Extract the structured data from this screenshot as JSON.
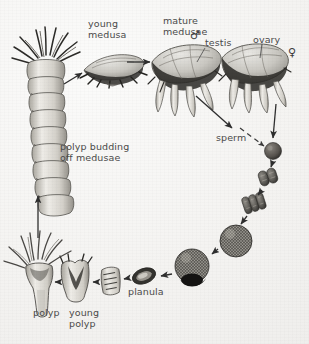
{
  "figure": {
    "background_color": "#f4f3f1",
    "ink_color": "#3c3c3c",
    "label_color": "#4a4a4a"
  },
  "labels": [
    {
      "id": "young-medusa",
      "text": "young\nmedusa",
      "x": 88,
      "y": 19
    },
    {
      "id": "mature-medusae",
      "text": "mature\nmedusae",
      "x": 163,
      "y": 16
    },
    {
      "id": "testis",
      "text": "testis",
      "x": 205,
      "y": 38
    },
    {
      "id": "ovary",
      "text": "ovary",
      "x": 253,
      "y": 35
    },
    {
      "id": "sperm",
      "text": "sperm",
      "x": 216,
      "y": 133
    },
    {
      "id": "polyp-budding",
      "text": "polyp budding\noff medusae",
      "x": 60,
      "y": 142
    },
    {
      "id": "planula",
      "text": "planula",
      "x": 128,
      "y": 287
    },
    {
      "id": "polyp",
      "text": "polyp",
      "x": 33,
      "y": 308
    },
    {
      "id": "young-polyp",
      "text": "young\npolyp",
      "x": 69,
      "y": 308
    }
  ],
  "symbols": [
    {
      "id": "male-symbol",
      "glyph": "♂",
      "x": 190,
      "y": 30
    },
    {
      "id": "female-symbol",
      "glyph": "♀",
      "x": 288,
      "y": 47
    }
  ],
  "stages": [
    {
      "id": "strobila",
      "name": "polyp budding off medusae (strobila)"
    },
    {
      "id": "young-medusa",
      "name": "young medusa"
    },
    {
      "id": "mature-medusa-male",
      "name": "mature medusa with testis"
    },
    {
      "id": "mature-medusa-female",
      "name": "mature medusa with ovary"
    },
    {
      "id": "sperm",
      "name": "sperm"
    },
    {
      "id": "egg",
      "name": "fertilized egg"
    },
    {
      "id": "two-cell",
      "name": "two-cell stage"
    },
    {
      "id": "four-cell",
      "name": "four-cell stage"
    },
    {
      "id": "blastula",
      "name": "blastula"
    },
    {
      "id": "gastrula",
      "name": "gastrula"
    },
    {
      "id": "planula",
      "name": "planula larva"
    },
    {
      "id": "settling-larva",
      "name": "settling larva"
    },
    {
      "id": "young-polyp",
      "name": "young polyp"
    },
    {
      "id": "polyp",
      "name": "polyp (scyphistoma)"
    }
  ],
  "arrows": [
    {
      "id": "arrow-strobila-to-young-medusa",
      "style": "solid"
    },
    {
      "id": "arrow-young-to-mature",
      "style": "solid"
    },
    {
      "id": "arrow-medusa-to-sperm",
      "style": "solid"
    },
    {
      "id": "arrow-sperm-to-egg",
      "style": "dashed"
    },
    {
      "id": "arrow-ovary-to-egg",
      "style": "solid"
    },
    {
      "id": "arrow-egg-to-two-cell",
      "style": "solid"
    },
    {
      "id": "arrow-two-to-four-cell",
      "style": "solid"
    },
    {
      "id": "arrow-four-cell-to-blastula",
      "style": "solid"
    },
    {
      "id": "arrow-blastula-to-gastrula",
      "style": "solid"
    },
    {
      "id": "arrow-gastrula-to-planula",
      "style": "solid"
    },
    {
      "id": "arrow-planula-to-settling",
      "style": "solid"
    },
    {
      "id": "arrow-settling-to-young-polyp",
      "style": "solid"
    },
    {
      "id": "arrow-young-polyp-to-polyp",
      "style": "solid"
    },
    {
      "id": "arrow-polyp-to-strobila",
      "style": "solid"
    }
  ]
}
